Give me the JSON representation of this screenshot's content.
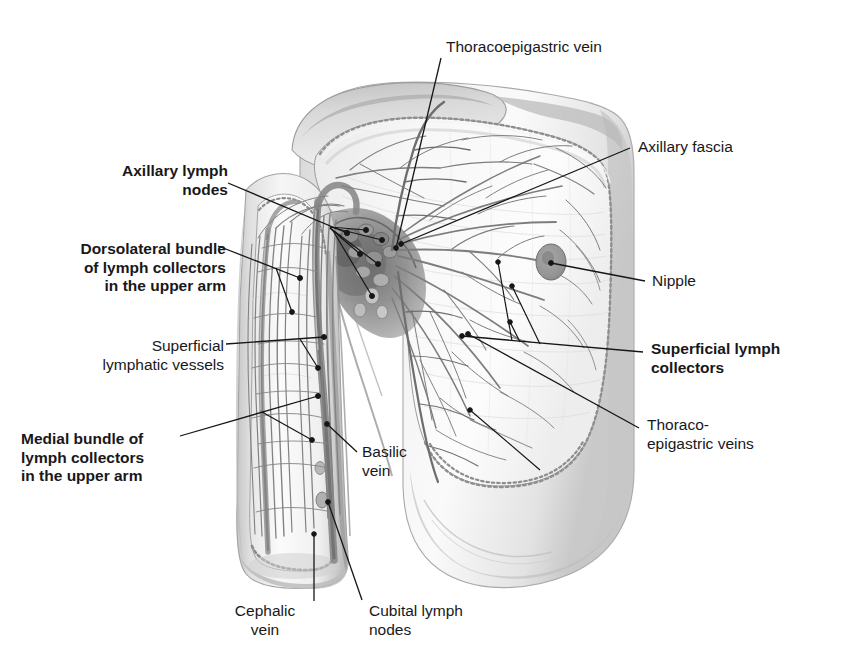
{
  "figure": {
    "background_color": "#ffffff",
    "line_color": "#161616",
    "ink_color": "#18181a"
  },
  "labels": [
    {
      "id": "thoracoepigastric-vein",
      "text": "Thoracoepigastric vein",
      "bold": false,
      "align": "left",
      "x": 446,
      "y": 38,
      "leader": [
        [
          441,
          58
        ],
        [
          396,
          248
        ]
      ]
    },
    {
      "id": "axillary-fascia",
      "text": "Axillary fascia",
      "bold": false,
      "align": "left",
      "x": 638,
      "y": 138,
      "leader": [
        [
          630,
          148
        ],
        [
          401,
          244
        ]
      ]
    },
    {
      "id": "nipple",
      "text": "Nipple",
      "bold": false,
      "align": "left",
      "x": 652,
      "y": 272,
      "leader": [
        [
          645,
          281
        ],
        [
          551,
          263
        ]
      ]
    },
    {
      "id": "superficial-lymph-collectors",
      "text": "Superficial lymph\ncollectors",
      "bold": true,
      "align": "left",
      "x": 651,
      "y": 347,
      "leader": [
        [
          643,
          352
        ],
        [
          462,
          336
        ]
      ]
    },
    {
      "id": "thoraco-epigastric-veins",
      "text": "Thoraco-\nepigastric veins",
      "bold": false,
      "align": "left",
      "x": 647,
      "y": 423,
      "leader": [
        [
          639,
          428
        ],
        [
          468,
          334
        ]
      ]
    },
    {
      "id": "axillary-lymph-nodes",
      "text": "Axillary lymph\nnodes",
      "bold": true,
      "align": "right",
      "x": 48,
      "y": 162,
      "leader": [
        [
          228,
          183
        ],
        [
          345,
          232
        ]
      ]
    },
    {
      "id": "dorsolateral-bundle",
      "text": "Dorsolateral bundle\nof lymph collectors\nin the upper arm",
      "bold": true,
      "align": "right",
      "x": 44,
      "y": 240,
      "leader": [
        [
          218,
          246
        ],
        [
          300,
          278
        ]
      ]
    },
    {
      "id": "superficial-lymphatic-vessels",
      "text": "Superficial\nlymphatic vessels",
      "bold": false,
      "align": "right",
      "x": 36,
      "y": 337,
      "leader": [
        [
          226,
          344
        ],
        [
          321,
          337
        ]
      ]
    },
    {
      "id": "medial-bundle",
      "text": "Medial bundle of\nlymph collectors\nin the upper arm",
      "bold": true,
      "align": "left",
      "x": 21,
      "y": 430,
      "leader": [
        [
          180,
          436
        ],
        [
          318,
          396
        ]
      ]
    },
    {
      "id": "basilic-vein",
      "text": "Basilic\nvein",
      "bold": false,
      "align": "left",
      "x": 362,
      "y": 443,
      "leader": [
        [
          357,
          452
        ],
        [
          327,
          428
        ]
      ]
    },
    {
      "id": "cephalic-vein",
      "text": "Cephalic\nvein",
      "bold": false,
      "align": "center",
      "x": 230,
      "y": 608,
      "leader": [
        [
          314,
          603
        ],
        [
          314,
          560
        ]
      ]
    },
    {
      "id": "cubital-lymph-nodes",
      "text": "Cubital lymph\nnodes",
      "bold": false,
      "align": "left",
      "x": 369,
      "y": 608,
      "leader": [
        [
          362,
          600
        ],
        [
          336,
          556
        ]
      ]
    }
  ],
  "anatomy": {
    "nipple": {
      "cx": 551,
      "cy": 262,
      "rx": 15,
      "ry": 18,
      "fill": "#9a9a9a"
    },
    "regions": [
      "shoulder-deltoid",
      "upper-arm",
      "chest-wall",
      "breast",
      "axillary-fossa",
      "dissection-window",
      "axillary-lymph-node-cluster",
      "cubital-lymph-node"
    ]
  }
}
